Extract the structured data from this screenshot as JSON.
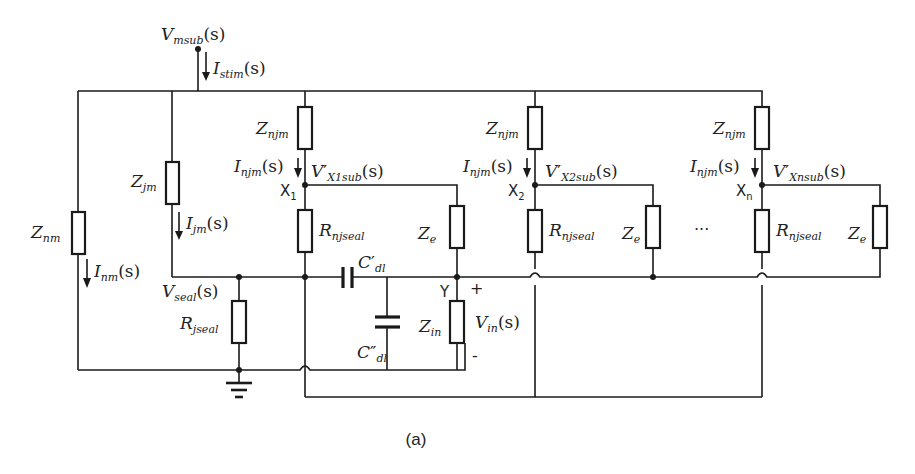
{
  "figure": {
    "caption": "(a)"
  },
  "source": {
    "node_label": "V",
    "node_sub": "msub",
    "node_suffix": "(s)",
    "current_label": "I",
    "current_sub": "stim",
    "current_suffix": "(s)"
  },
  "branches": {
    "znm": {
      "label": "Z",
      "sub": "nm",
      "current": "I",
      "current_sub": "nm",
      "current_suffix": "(s)"
    },
    "zjm": {
      "label": "Z",
      "sub": "jm",
      "current": "I",
      "current_sub": "jm",
      "current_suffix": "(s)"
    },
    "seal": {
      "node_label": "V",
      "node_sub": "seal",
      "node_suffix": "(s)",
      "resistor": "R",
      "resistor_sub": "jseal"
    }
  },
  "sites": [
    {
      "node": "X",
      "node_sub": "1",
      "z_njm": "Z",
      "z_njm_sub": "njm",
      "current": "I",
      "current_sub": "njm",
      "current_suffix": "(s)",
      "voltage": "V",
      "voltage_prime": "′",
      "voltage_sub": "X1sub",
      "voltage_suffix": "(s)",
      "r_seal": "R",
      "r_seal_sub": "njseal",
      "ze": "Z",
      "ze_sub": "e"
    },
    {
      "node": "X",
      "node_sub": "2",
      "z_njm": "Z",
      "z_njm_sub": "njm",
      "current": "I",
      "current_sub": "njm",
      "current_suffix": "(s)",
      "voltage": "V",
      "voltage_prime": "′",
      "voltage_sub": "X2sub",
      "voltage_suffix": "(s)",
      "r_seal": "R",
      "r_seal_sub": "njseal",
      "ze": "Z",
      "ze_sub": "e"
    },
    {
      "node": "X",
      "node_sub": "n",
      "z_njm": "Z",
      "z_njm_sub": "njm",
      "current": "I",
      "current_sub": "njm",
      "current_suffix": "(s)",
      "voltage": "V",
      "voltage_prime": "′",
      "voltage_sub": "Xnsub",
      "voltage_suffix": "(s)",
      "r_seal": "R",
      "r_seal_sub": "njseal",
      "ze": "Z",
      "ze_sub": "e"
    }
  ],
  "ellipsis": "···",
  "input_stage": {
    "cdl1": "C",
    "cdl1_prime": "′",
    "cdl1_sub": "dl",
    "cdl2": "C",
    "cdl2_prime": "″",
    "cdl2_sub": "dl",
    "node": "Y",
    "zin": "Z",
    "zin_sub": "in",
    "vin": "V",
    "vin_sub": "in",
    "vin_suffix": "(s)",
    "plus": "+",
    "minus": "-"
  }
}
